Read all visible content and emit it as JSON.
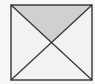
{
  "diagram": {
    "shape": "square-with-diagonals",
    "square": {
      "x": 11,
      "y": 5,
      "w": 81,
      "h": 75
    },
    "center": {
      "x": 51,
      "y": 43
    },
    "shaded_region": "top-triangle",
    "colors": {
      "background": "#f7f7f7",
      "stroke": "#333333",
      "shade": "#d0d0d0",
      "fill": "#f2f2f2"
    }
  }
}
